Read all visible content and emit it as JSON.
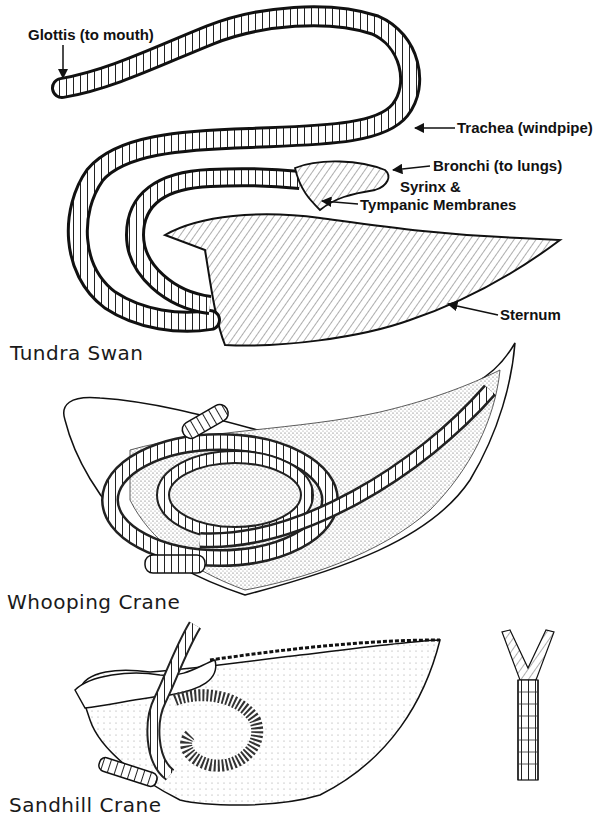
{
  "figure": {
    "panels": [
      {
        "species": "Tundra Swan",
        "labels": {
          "glottis": "Glottis (to mouth)",
          "trachea": "Trachea (windpipe)",
          "bronchi": "Bronchi (to lungs)",
          "syrinx_line1": "Syrinx &",
          "syrinx_line2": "Tympanic Membranes",
          "sternum": "Sternum"
        }
      },
      {
        "species": "Whooping Crane"
      },
      {
        "species": "Sandhill Crane"
      }
    ],
    "colors": {
      "ink": "#111111",
      "background": "#ffffff",
      "stipple": "#555555"
    }
  }
}
